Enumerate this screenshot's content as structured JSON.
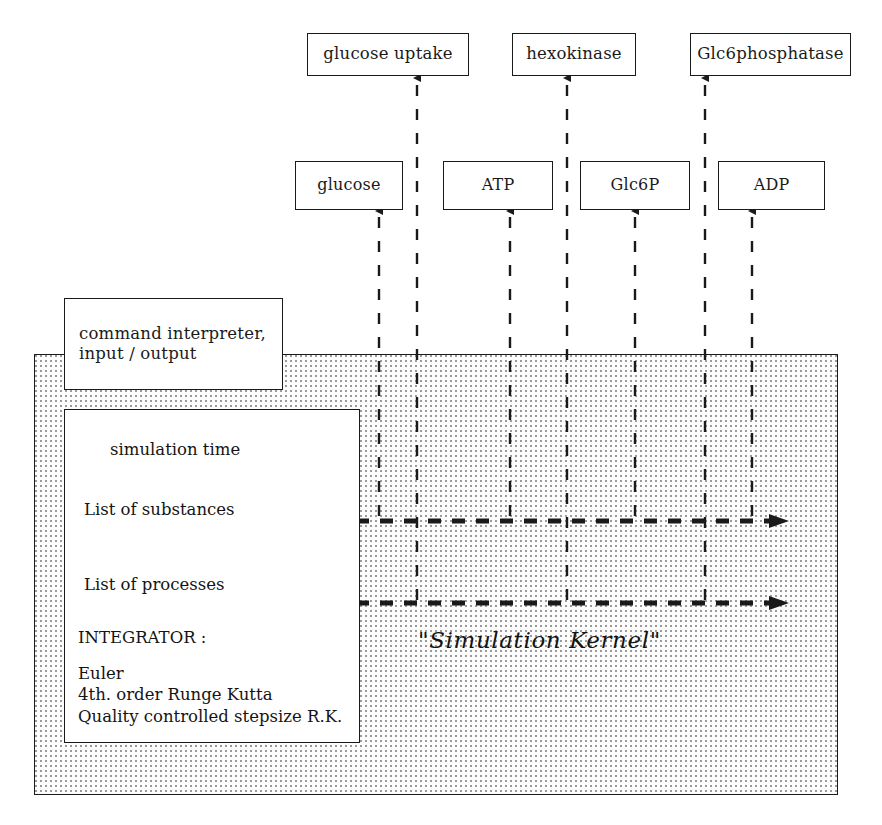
{
  "diagram": {
    "kernel_label": "\"Simulation Kernel\"",
    "colors": {
      "stroke": "#1a1a1a",
      "fill": "#ffffff",
      "kernel_fill": "#fdfdfd",
      "kernel_dots": "#9a9a9a"
    }
  },
  "process_nodes": [
    {
      "id": "glucose-uptake",
      "label": "glucose uptake",
      "x": 307,
      "y": 33,
      "w": 162,
      "h": 43
    },
    {
      "id": "hexokinase",
      "label": "hexokinase",
      "x": 512,
      "y": 33,
      "w": 124,
      "h": 43
    },
    {
      "id": "glc6phosphatase",
      "label": "Glc6phosphatase",
      "x": 690,
      "y": 33,
      "w": 161,
      "h": 43
    }
  ],
  "substance_nodes": [
    {
      "id": "glucose",
      "label": "glucose",
      "x": 295,
      "y": 161,
      "w": 108,
      "h": 49
    },
    {
      "id": "atp",
      "label": "ATP",
      "x": 443,
      "y": 161,
      "w": 110,
      "h": 49
    },
    {
      "id": "glc6p",
      "label": "Glc6P",
      "x": 580,
      "y": 161,
      "w": 110,
      "h": 49
    },
    {
      "id": "adp",
      "label": "ADP",
      "x": 718,
      "y": 161,
      "w": 107,
      "h": 49
    }
  ],
  "command_panel": {
    "label_line1": "command interpreter,",
    "label_line2": "input / output",
    "x": 64,
    "y": 298,
    "w": 219,
    "h": 92
  },
  "kernel_panel": {
    "x": 34,
    "y": 354,
    "w": 804,
    "h": 441
  },
  "inner_panel": {
    "x": 64,
    "y": 409,
    "w": 296,
    "h": 334,
    "items": [
      {
        "id": "simulation-time",
        "label": "simulation time",
        "x": 110,
        "y": 440
      },
      {
        "id": "list-of-substances",
        "label": "List of substances",
        "x": 84,
        "y": 500
      },
      {
        "id": "list-of-processes",
        "label": "List of processes",
        "x": 84,
        "y": 575
      }
    ],
    "integrator": {
      "heading": "INTEGRATOR :",
      "x": 78,
      "y": 628,
      "methods": [
        "Euler",
        "4th. order Runge Kutta",
        "Quality controlled stepsize R.K."
      ],
      "methods_x": 78,
      "methods_y": 663
    }
  },
  "kernel_label_pos": {
    "x": 418,
    "y": 627
  },
  "vertical_connectors": [
    {
      "id": "conn-glucose",
      "x": 379,
      "y_top": 211,
      "y_bottom": 516,
      "arrow": "up",
      "to": "glucose"
    },
    {
      "id": "conn-glucose-uptake",
      "x": 417,
      "y_top": 78,
      "y_bottom": 600,
      "arrow": "up",
      "to": "glucose uptake"
    },
    {
      "id": "conn-atp",
      "x": 510,
      "y_top": 211,
      "y_bottom": 516,
      "arrow": "up",
      "to": "ATP"
    },
    {
      "id": "conn-hexokinase",
      "x": 567,
      "y_top": 78,
      "y_bottom": 600,
      "arrow": "up",
      "to": "hexokinase"
    },
    {
      "id": "conn-glc6p",
      "x": 635,
      "y_top": 211,
      "y_bottom": 516,
      "arrow": "up",
      "to": "Glc6P"
    },
    {
      "id": "conn-adp",
      "x": 752,
      "y_top": 211,
      "y_bottom": 516,
      "arrow": "up",
      "to": "ADP"
    },
    {
      "id": "conn-glc6phosphatase",
      "x": 705,
      "y_top": 78,
      "y_bottom": 600,
      "arrow": "up",
      "to": "Glc6phosphatase"
    }
  ],
  "horizontal_connectors": [
    {
      "id": "bus-substances",
      "y": 521,
      "x_start": 284,
      "x_end": 788,
      "arrow": "right",
      "from": "List of substances"
    },
    {
      "id": "bus-processes",
      "y": 603,
      "x_start": 284,
      "x_end": 788,
      "arrow": "right",
      "from": "List of processes"
    }
  ]
}
